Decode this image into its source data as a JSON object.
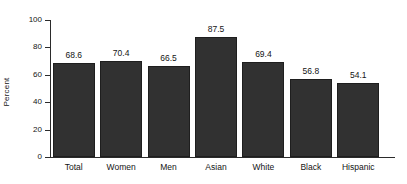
{
  "chart_data": {
    "type": "bar",
    "title": "",
    "subtitle": "",
    "xlabel": "",
    "ylabel": "Percent",
    "categories": [
      "Total",
      "Women",
      "Men",
      "Asian",
      "White",
      "Black",
      "Hispanic"
    ],
    "values": [
      68.6,
      70.4,
      66.5,
      87.5,
      69.4,
      56.8,
      54.1
    ],
    "value_labels": [
      "68.6",
      "70.4",
      "66.5",
      "87.5",
      "69.4",
      "56.8",
      "54.1"
    ],
    "ylim": [
      0,
      100
    ],
    "yticks": [
      0,
      20,
      40,
      60,
      80,
      100
    ],
    "ytick_labels": [
      "0",
      "20",
      "40",
      "60",
      "80",
      "100"
    ],
    "grid": false,
    "legend": null,
    "legend_position": "none",
    "bar_color": "#313131",
    "bar_edge_color": "#1e1e1e",
    "axis_color": "#2b2b2b",
    "text_color": "#141414",
    "background_color": "#ffffff"
  }
}
